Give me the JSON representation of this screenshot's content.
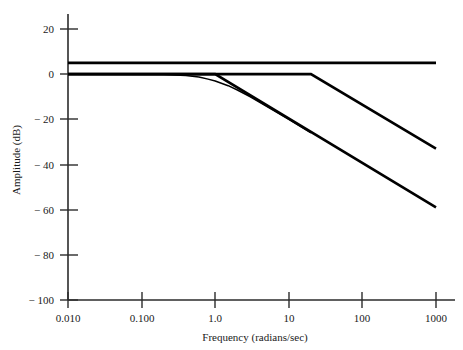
{
  "chart_data": {
    "type": "line",
    "title": "",
    "xlabel": "Frequency (radians/sec)",
    "ylabel": "Amplitude (dB)",
    "xscale": "log",
    "xlim": [
      0.01,
      1000
    ],
    "ylim": [
      -100,
      20
    ],
    "grid": false,
    "legend": "none",
    "xticks": [
      0.01,
      0.1,
      1.0,
      10,
      100,
      1000
    ],
    "xticklabels": [
      "0.010",
      "0.100",
      "1.0",
      "10",
      "100",
      "1000"
    ],
    "yticks": [
      20,
      0,
      -20,
      -40,
      -60,
      -80,
      -100
    ],
    "yticklabels": [
      "20",
      "0",
      "− 20",
      "− 40",
      "− 60",
      "− 80",
      "− 100"
    ],
    "series": [
      {
        "name": "asymptote-upper-flat",
        "comment": "flat gain line at about +5 dB across whole range",
        "x": [
          0.01,
          1000
        ],
        "y": [
          5,
          5
        ]
      },
      {
        "name": "asymptote-two-break",
        "comment": "0 dB flat until break at 20 rad/s then -20 dB/decade to -33 dB at 1000",
        "x": [
          0.01,
          20,
          1000
        ],
        "y": [
          0,
          0,
          -33
        ]
      },
      {
        "name": "asymptote-single-break",
        "comment": "0 dB flat until break at 1.0 rad/s then about -20 dB/decade to -59 dB at 1000",
        "x": [
          0.01,
          1.0,
          1000
        ],
        "y": [
          0,
          0,
          -59
        ]
      },
      {
        "name": "actual-response-curve",
        "comment": "smooth actual magnitude response rounding the 1.0 rad/s corner",
        "x": [
          0.01,
          0.2,
          0.4,
          0.6,
          0.8,
          1.0,
          1.5,
          2.0,
          3.0,
          5.0,
          10,
          20
        ],
        "y": [
          0,
          -0.2,
          -0.6,
          -1.3,
          -2.2,
          -3.0,
          -5.1,
          -7.0,
          -10.0,
          -14.2,
          -20.0,
          -26.0
        ]
      }
    ],
    "annotations": [
      {
        "label": "break-frequency-1",
        "x": 1.0,
        "y": 0
      },
      {
        "label": "break-frequency-2",
        "x": 20,
        "y": 0
      }
    ]
  }
}
